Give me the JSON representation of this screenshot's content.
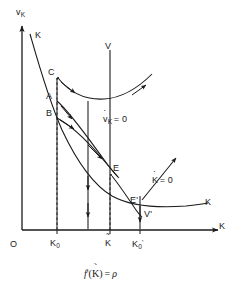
{
  "figure": {
    "kind": "phase-diagram",
    "caption": "f'(K̃) = ρ",
    "caption_parts": {
      "func": "f",
      "prime": "'",
      "arg": "K",
      "arg_accent": "tilde",
      "equals": "=",
      "rhs": "ρ"
    },
    "axes": {
      "x_label": "K",
      "y_label_base": "v",
      "y_label_sub": "K",
      "origin_label": "O",
      "x_ticks": [
        {
          "id": "K0",
          "base": "K",
          "sub": "0",
          "accent": "none"
        },
        {
          "id": "Ktilde",
          "base": "K",
          "sub": "",
          "accent": "tilde"
        },
        {
          "id": "K0prime",
          "base": "K",
          "sub": "0",
          "accent": "none",
          "prime": "'"
        }
      ]
    },
    "curve_labels": [
      {
        "id": "k-curve-top",
        "text": "K"
      },
      {
        "id": "v-locus",
        "text": "V"
      },
      {
        "id": "v-prime-locus",
        "text": "V'"
      },
      {
        "id": "k-curve-right",
        "text": "K"
      },
      {
        "id": "point-c",
        "text": "C"
      },
      {
        "id": "point-a",
        "text": "A"
      },
      {
        "id": "point-b",
        "text": "B"
      },
      {
        "id": "point-e",
        "text": "E"
      },
      {
        "id": "point-e-prime",
        "text": "E'"
      }
    ],
    "locus_labels": [
      {
        "id": "vdot-zero",
        "base": "v",
        "accent": "dot",
        "sub": "K",
        "rest": "= 0"
      },
      {
        "id": "kdot-zero",
        "base": "K",
        "accent": "dot",
        "sub": "",
        "rest": "= 0"
      }
    ],
    "colors": {
      "ink": "#1a1a1a",
      "background": "#ffffff"
    }
  }
}
